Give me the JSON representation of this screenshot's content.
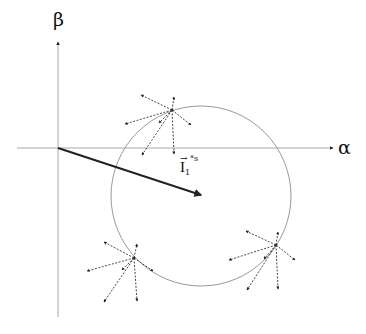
{
  "diagram": {
    "axes": {
      "origin": [
        58,
        148
      ],
      "x_axis": {
        "label": "α",
        "from": [
          17,
          148
        ],
        "to": [
          333,
          148
        ]
      },
      "y_axis": {
        "label": "β",
        "from": [
          58,
          317
        ],
        "to": [
          58,
          42
        ]
      },
      "color": "#a8a8a8"
    },
    "circle": {
      "cx": 201,
      "cy": 196,
      "r": 90,
      "color": "#9a9a9a"
    },
    "vector": {
      "label_main": "I",
      "label_sub": "1",
      "label_sup": "*s",
      "label_arrow": "→",
      "from": [
        58,
        148
      ],
      "to": [
        201,
        195
      ],
      "color": "#222222"
    },
    "stars": [
      {
        "center": [
          172,
          110
        ],
        "endpoints": [
          [
            141,
            95
          ],
          [
            174,
            97
          ],
          [
            191,
            125
          ],
          [
            159,
            123
          ],
          [
            125,
            124
          ],
          [
            142,
            155
          ],
          [
            174,
            154
          ]
        ]
      },
      {
        "center": [
          134,
          258
        ],
        "endpoints": [
          [
            104,
            242
          ],
          [
            137,
            244
          ],
          [
            153,
            271
          ],
          [
            122,
            270
          ],
          [
            87,
            271
          ],
          [
            104,
            302
          ],
          [
            137,
            301
          ]
        ]
      },
      {
        "center": [
          276,
          245
        ],
        "endpoints": [
          [
            246,
            231
          ],
          [
            278,
            232
          ],
          [
            295,
            260
          ],
          [
            264,
            259
          ],
          [
            229,
            260
          ],
          [
            247,
            290
          ],
          [
            278,
            289
          ]
        ]
      }
    ],
    "star_color": "#333333"
  }
}
